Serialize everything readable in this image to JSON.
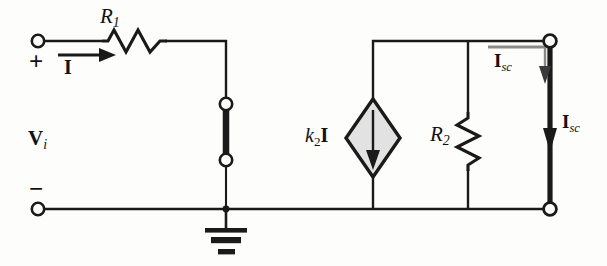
{
  "figure": {
    "background_color": "#fdfdfb",
    "wire_color": "#1a1a1a",
    "source_fill_color": "#e2e2e2",
    "measure_arrow_color": "#8a8a8a"
  },
  "labels": {
    "r1": "R",
    "r1_sub": "1",
    "r2": "R",
    "r2_sub": "2",
    "vi": "V",
    "vi_sub": "i",
    "input_current": "I",
    "dependent_source_k": "k",
    "dependent_source_sub": "2",
    "dependent_source_current": "I",
    "isc_top": "I",
    "isc_top_sub": "sc",
    "isc_bottom": "I",
    "isc_bottom_sub": "sc",
    "plus_terminal": "+",
    "minus_terminal": "−"
  },
  "components": {
    "resistor_r1": "horizontal-zigzag-resistor",
    "resistor_r2": "vertical-zigzag-resistor",
    "current_source": "diamond-dependent-current-source",
    "ground": "earth-ground-symbol",
    "short_link": "vertical-shorting-bar",
    "short_circuit_wire": "thick-short-circuit-wire"
  },
  "terminals": [
    {
      "name": "input-positive",
      "x": 38,
      "y": 41
    },
    {
      "name": "input-negative",
      "x": 38,
      "y": 209
    },
    {
      "name": "short-link-top",
      "x": 226,
      "y": 104
    },
    {
      "name": "short-link-bottom",
      "x": 226,
      "y": 160
    },
    {
      "name": "output-positive",
      "x": 550,
      "y": 41
    },
    {
      "name": "output-negative",
      "x": 550,
      "y": 209
    }
  ]
}
